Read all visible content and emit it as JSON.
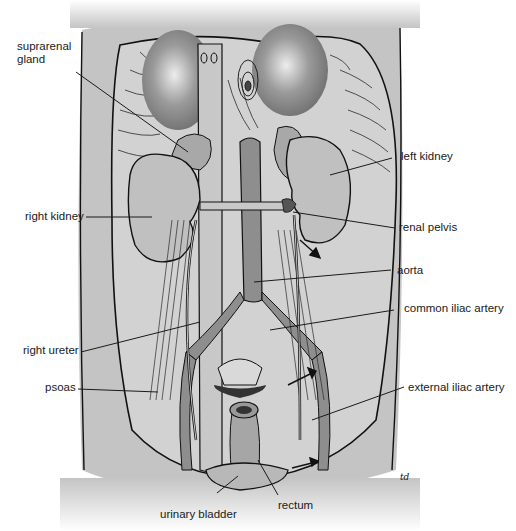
{
  "figure": {
    "artist_signature": "td",
    "colors": {
      "background": "#ffffff",
      "body_fill": "#c4c4c4",
      "cavity_fill": "#d2d2d2",
      "muscle_stroke": "#2a2a2a",
      "organ_fill": "#bdbdbd",
      "vessel_fill": "#8e8e8e",
      "outline": "#111111",
      "label_text": "#1a1a1a",
      "leader_line": "#1a1a1a"
    }
  },
  "labels": {
    "suprarenal_gland": "suprarenal\ngland",
    "suprarenal_line1": "suprarenal",
    "suprarenal_line2": "gland",
    "left_kidney": "left kidney",
    "right_kidney": "right kidney",
    "renal_pelvis": "renal pelvis",
    "aorta": "aorta",
    "common_iliac_artery": "common iliac artery",
    "right_ureter": "right ureter",
    "psoas": "psoas",
    "external_iliac_artery": "external iliac artery",
    "urinary_bladder": "urinary bladder",
    "rectum": "rectum"
  }
}
